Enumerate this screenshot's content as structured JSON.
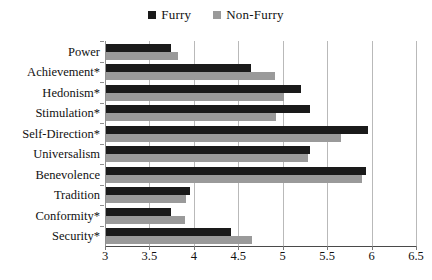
{
  "chart_data": {
    "type": "bar",
    "orientation": "horizontal",
    "title": "",
    "xlabel": "",
    "ylabel": "",
    "xlim": [
      3,
      6.5
    ],
    "xticks": [
      "3",
      "3.5",
      "4",
      "4.5",
      "5",
      "5.5",
      "6",
      "6.5"
    ],
    "xtick_values": [
      3,
      3.5,
      4,
      4.5,
      5,
      5.5,
      6,
      6.5
    ],
    "grid": true,
    "legend_position": "top-center",
    "categories": [
      "Power",
      "Achievement*",
      "Hedonism*",
      "Stimulation*",
      "Self-Direction*",
      "Universalism",
      "Benevolence",
      "Tradition",
      "Conformity*",
      "Security*"
    ],
    "series": [
      {
        "name": "Furry",
        "color": "#1a1a1a",
        "values": [
          3.74,
          4.64,
          5.21,
          5.31,
          5.96,
          5.31,
          5.94,
          3.96,
          3.74,
          4.42
        ]
      },
      {
        "name": "Non-Furry",
        "color": "#9a9a9a",
        "values": [
          3.82,
          4.91,
          5.02,
          4.92,
          5.66,
          5.28,
          5.89,
          3.91,
          3.9,
          4.65
        ]
      }
    ]
  },
  "legend": {
    "items": [
      {
        "label": "Furry",
        "color": "#1a1a1a",
        "swatch": "square-marker-icon"
      },
      {
        "label": "Non-Furry",
        "color": "#9a9a9a",
        "swatch": "square-marker-icon"
      }
    ]
  },
  "colors": {
    "furry": "#1a1a1a",
    "non_furry": "#9a9a9a",
    "gridline": "#b9b9b9",
    "axis": "#4a4a4a",
    "background": "#ffffff"
  }
}
